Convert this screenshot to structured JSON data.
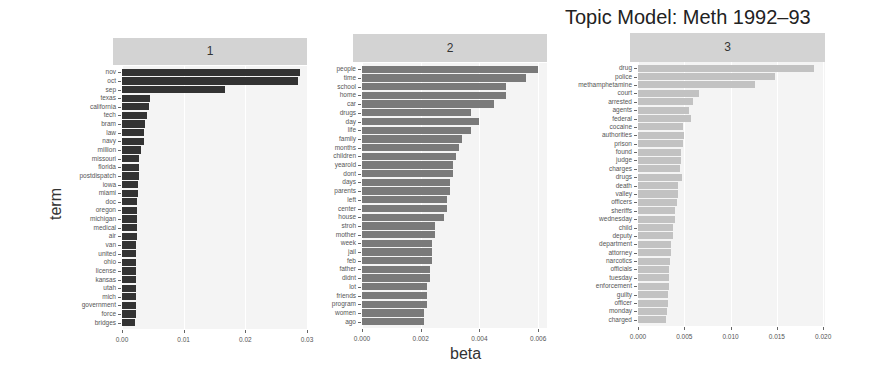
{
  "chart_data": {
    "type": "bar",
    "title": "Topic Model: Meth 1992–93",
    "xlabel": "beta",
    "ylabel": "term",
    "orientation": "horizontal",
    "facets": [
      {
        "label": "1",
        "color": "#333333",
        "xlim": [
          0,
          0.03
        ],
        "ticks": [
          "0.00",
          "0.01",
          "0.02",
          "0.03"
        ],
        "tick_values": [
          0,
          0.01,
          0.02,
          0.03
        ],
        "terms": [
          "nov",
          "oct",
          "sep",
          "texas",
          "california",
          "tech",
          "bram",
          "law",
          "navy",
          "million",
          "missouri",
          "florida",
          "postdispatch",
          "iowa",
          "miami",
          "doc",
          "oregon",
          "michigan",
          "medical",
          "air",
          "van",
          "united",
          "ohio",
          "license",
          "kansas",
          "utah",
          "mich",
          "government",
          "force",
          "bridges"
        ],
        "values": [
          0.0288,
          0.0285,
          0.0167,
          0.0045,
          0.0044,
          0.004,
          0.0038,
          0.0036,
          0.0035,
          0.0031,
          0.0028,
          0.0027,
          0.0027,
          0.0026,
          0.0026,
          0.0025,
          0.0025,
          0.0024,
          0.0024,
          0.0024,
          0.0023,
          0.0023,
          0.0023,
          0.0023,
          0.0023,
          0.0022,
          0.0022,
          0.0022,
          0.0022,
          0.0021
        ]
      },
      {
        "label": "2",
        "color": "#7a7a7a",
        "xlim": [
          0,
          0.0063
        ],
        "ticks": [
          "0.000",
          "0.002",
          "0.004",
          "0.006"
        ],
        "tick_values": [
          0,
          0.002,
          0.004,
          0.006
        ],
        "terms": [
          "people",
          "time",
          "school",
          "home",
          "car",
          "drugs",
          "day",
          "life",
          "family",
          "months",
          "children",
          "yearold",
          "dont",
          "days",
          "parents",
          "left",
          "center",
          "house",
          "stroh",
          "mother",
          "week",
          "jail",
          "feb",
          "father",
          "didnt",
          "lot",
          "friends",
          "program",
          "women",
          "ago"
        ],
        "values": [
          0.006,
          0.0056,
          0.0049,
          0.0049,
          0.0045,
          0.0037,
          0.004,
          0.0037,
          0.0034,
          0.0033,
          0.0032,
          0.0031,
          0.0031,
          0.003,
          0.003,
          0.0029,
          0.0029,
          0.0028,
          0.0025,
          0.0025,
          0.0024,
          0.0024,
          0.0024,
          0.0023,
          0.0023,
          0.0022,
          0.0022,
          0.0022,
          0.0021,
          0.0021
        ]
      },
      {
        "label": "3",
        "color": "#c2c2c2",
        "xlim": [
          0,
          0.0202
        ],
        "ticks": [
          "0.000",
          "0.005",
          "0.010",
          "0.015",
          "0.020"
        ],
        "tick_values": [
          0,
          0.005,
          0.01,
          0.015,
          0.02
        ],
        "terms": [
          "drug",
          "police",
          "methamphetamine",
          "court",
          "arrested",
          "agents",
          "federal",
          "cocaine",
          "authorities",
          "prison",
          "found",
          "judge",
          "charges",
          "drugs",
          "death",
          "valley",
          "officers",
          "sheriffs",
          "wednesday",
          "child",
          "deputy",
          "department",
          "attorney",
          "narcotics",
          "officials",
          "tuesday",
          "enforcement",
          "guilty",
          "officer",
          "monday",
          "charged"
        ],
        "values": [
          0.019,
          0.0148,
          0.0126,
          0.0066,
          0.0059,
          0.0055,
          0.0057,
          0.0049,
          0.005,
          0.0049,
          0.0046,
          0.0046,
          0.0045,
          0.0048,
          0.0043,
          0.0043,
          0.0042,
          0.004,
          0.004,
          0.0038,
          0.0038,
          0.0036,
          0.0036,
          0.0035,
          0.0034,
          0.0034,
          0.0033,
          0.0032,
          0.0032,
          0.0031,
          0.003
        ]
      }
    ],
    "grid": true,
    "legend": "none"
  },
  "layout": {
    "panels": [
      {
        "strip": [
          113,
          38,
          194,
          27
        ],
        "plot": [
          122,
          66,
          185,
          263
        ]
      },
      {
        "strip": [
          353,
          34,
          194,
          28
        ],
        "plot": [
          362,
          63,
          185,
          265
        ]
      },
      {
        "strip": [
          630,
          33,
          195,
          29
        ],
        "plot": [
          638,
          62,
          187,
          264
        ]
      }
    ]
  }
}
